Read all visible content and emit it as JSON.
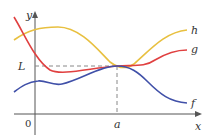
{
  "diagram": {
    "axes": {
      "x_label": "x",
      "y_label": "y",
      "origin_label": "0"
    },
    "markers": {
      "limit_label": "L",
      "point_label": "a"
    },
    "curves": [
      {
        "name": "h",
        "label": "h",
        "color": "#e8c040"
      },
      {
        "name": "g",
        "label": "g",
        "color": "#e04040"
      },
      {
        "name": "f",
        "label": "f",
        "color": "#4050a8"
      }
    ],
    "colors": {
      "axis": "#555555",
      "dashed": "#888888"
    }
  }
}
